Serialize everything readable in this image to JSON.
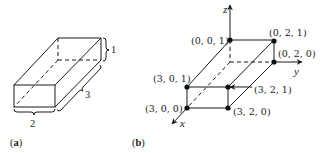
{
  "figure_a": {
    "caption_open": "(",
    "caption_letter": "a",
    "caption_close": ")",
    "dimensions": {
      "height_label": "1",
      "length_label": "3",
      "width_label": "2"
    }
  },
  "figure_b": {
    "caption_open": "(",
    "caption_letter": "b",
    "caption_close": ")",
    "axes": {
      "x": "x",
      "y": "y",
      "z": "z"
    },
    "points": {
      "p001": "(0, 0, 1)",
      "p021": "(0, 2, 1)",
      "p020": "(0, 2, 0)",
      "p301": "(3, 0, 1)",
      "p321": "(3, 2, 1)",
      "p300": "(3, 0, 0)",
      "p320": "(3, 2, 0)"
    }
  }
}
